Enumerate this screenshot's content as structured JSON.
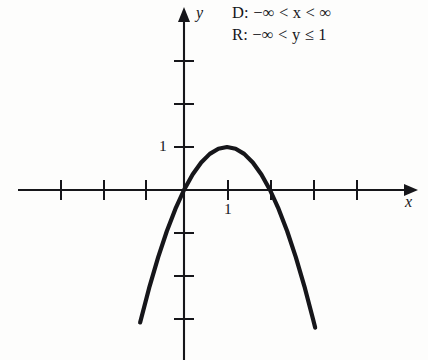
{
  "figure": {
    "background_color": "#fdfdfc",
    "ink_color": "#16161a"
  },
  "annotations": {
    "domain_line": "D: −∞ < x < ∞",
    "range_line": "R: −∞ < y ≤ 1"
  },
  "axes": {
    "x_label": "x",
    "y_label": "y",
    "origin_px": [
      184,
      190
    ],
    "unit_px": 43,
    "x_tick_label": "1",
    "y_tick_label": "1",
    "x_ticks_units": [
      -3,
      -2,
      -1,
      1,
      2,
      3,
      4
    ],
    "y_ticks_units": [
      3,
      2,
      1,
      -1,
      -2,
      -3
    ],
    "x_axis_range_px": [
      18,
      412
    ],
    "y_axis_range_px": [
      8,
      360
    ],
    "arrowheads": [
      "x-positive",
      "y-positive"
    ]
  },
  "chart_data": {
    "type": "line",
    "title": "",
    "xlabel": "x",
    "ylabel": "y",
    "grid": false,
    "legend": null,
    "curve_label": "y = 1 − (x − 1)²",
    "vertex": [
      1,
      1
    ],
    "x_intercepts": [
      0,
      2
    ],
    "xlim": [
      -3.9,
      5.3
    ],
    "ylim": [
      -4.0,
      3.6
    ],
    "x": [
      -1.02,
      -0.8,
      -0.6,
      -0.4,
      -0.2,
      0.0,
      0.2,
      0.4,
      0.6,
      0.8,
      1.0,
      1.2,
      1.4,
      1.6,
      1.8,
      2.0,
      2.2,
      2.4,
      2.6,
      2.8,
      3.0,
      3.05
    ],
    "y": [
      -3.08,
      -2.24,
      -1.56,
      -0.96,
      -0.44,
      0.0,
      0.36,
      0.64,
      0.84,
      0.96,
      1.0,
      0.96,
      0.84,
      0.64,
      0.36,
      0.0,
      -0.44,
      -0.96,
      -1.56,
      -2.24,
      -3.0,
      -3.2
    ]
  }
}
